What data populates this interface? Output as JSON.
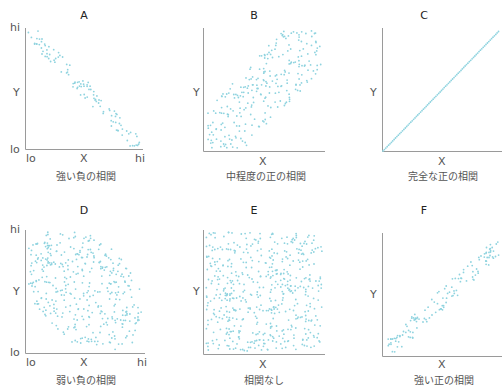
{
  "colors": {
    "point": "#8fd3df",
    "axis": "#9a9a9a",
    "text": "#555555",
    "title": "#222222"
  },
  "chart_data": [
    {
      "type": "scatter",
      "panel": "A",
      "title": "A",
      "xlabel": "X",
      "ylabel": "Y",
      "caption": "強い負の相関",
      "x_ticks": [
        "lo",
        "hi"
      ],
      "y_ticks": [
        "lo",
        "hi"
      ],
      "correlation": "strong negative",
      "r_approx": -0.95,
      "shape": "narrow band from top-left to bottom-right"
    },
    {
      "type": "scatter",
      "panel": "B",
      "title": "B",
      "xlabel": "X",
      "ylabel": "Y",
      "caption": "中程度の正の相関",
      "correlation": "moderate positive",
      "r_approx": 0.6,
      "shape": "wide band from bottom-left to top-right"
    },
    {
      "type": "line",
      "panel": "C",
      "title": "C",
      "xlabel": "X",
      "ylabel": "Y",
      "caption": "完全な正の相関",
      "correlation": "perfect positive",
      "r_approx": 1.0,
      "shape": "dotted diagonal line"
    },
    {
      "type": "scatter",
      "panel": "D",
      "title": "D",
      "xlabel": "X",
      "ylabel": "Y",
      "caption": "弱い負の相関",
      "x_ticks": [
        "lo",
        "hi"
      ],
      "y_ticks": [
        "lo",
        "hi"
      ],
      "correlation": "weak negative",
      "r_approx": -0.4,
      "shape": "wide ellipse tilted downward"
    },
    {
      "type": "scatter",
      "panel": "E",
      "title": "E",
      "xlabel": "X",
      "ylabel": "Y",
      "caption": "相関なし",
      "correlation": "none",
      "r_approx": 0.0,
      "shape": "uniform square fill"
    },
    {
      "type": "scatter",
      "panel": "F",
      "title": "F",
      "xlabel": "X",
      "ylabel": "Y",
      "caption": "強い正の相関",
      "correlation": "strong positive",
      "r_approx": 0.95,
      "shape": "narrow band from bottom-left to top-right"
    }
  ],
  "panels": [
    {
      "title": "A",
      "x": "X",
      "y": "Y",
      "caption": "強い負の相関",
      "lo": "lo",
      "hi": "hi"
    },
    {
      "title": "B",
      "x": "X",
      "y": "Y",
      "caption": "中程度の正の相関"
    },
    {
      "title": "C",
      "x": "X",
      "y": "Y",
      "caption": "完全な正の相関"
    },
    {
      "title": "D",
      "x": "X",
      "y": "Y",
      "caption": "弱い負の相関",
      "lo": "lo",
      "hi": "hi"
    },
    {
      "title": "E",
      "x": "X",
      "y": "Y",
      "caption": "相関なし"
    },
    {
      "title": "F",
      "x": "X",
      "y": "Y",
      "caption": "強い正の相関"
    }
  ]
}
